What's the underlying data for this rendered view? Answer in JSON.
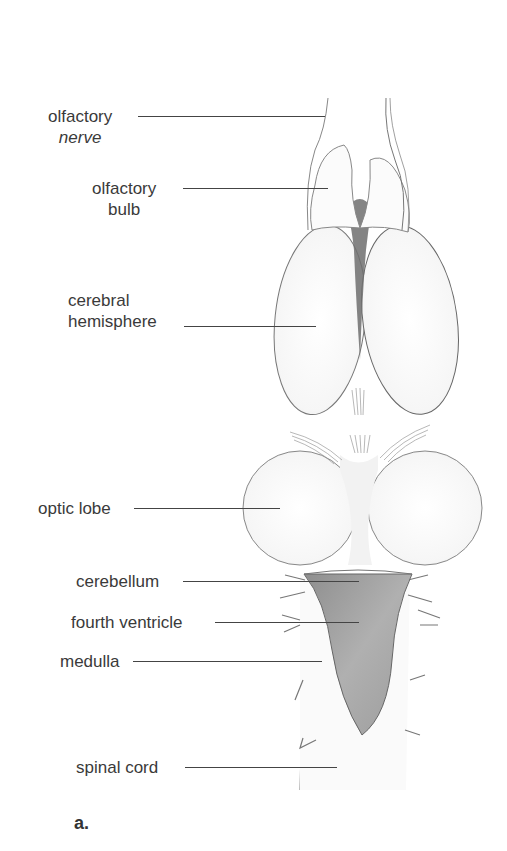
{
  "figure": {
    "panel_letter": "a."
  },
  "labels": {
    "olfactory_nerve": {
      "line1": "olfactory",
      "line2": "nerve"
    },
    "olfactory_bulb": {
      "line1": "olfactory",
      "line2": "bulb"
    },
    "cerebral_hemisphere": {
      "line1": "cerebral",
      "line2": "hemisphere"
    },
    "optic_lobe": "optic lobe",
    "cerebellum": "cerebellum",
    "fourth_ventricle": "fourth ventricle",
    "medulla": "medulla",
    "spinal_cord": "spinal cord"
  },
  "colors": {
    "text": "#3a3a3a",
    "outline": "#555555",
    "ventricle_fill": "#9a9a9a",
    "dark_fill": "#6e6e6e"
  }
}
